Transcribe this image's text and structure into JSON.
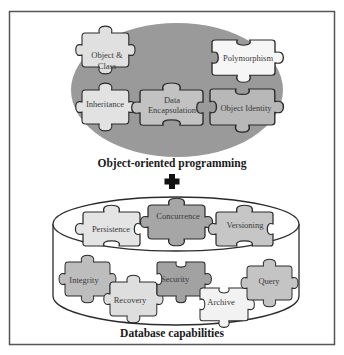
{
  "figure": {
    "frame": {
      "stroke": "#555555"
    },
    "colors": {
      "oop_ellipse": "#9a9a9a",
      "piece_outline": "#2b2b2b",
      "piece_light": "#e6e6e6",
      "piece_white": "#f6f6f6",
      "piece_mid": "#c4c4c4",
      "piece_dark": "#a8a8a8",
      "cylinder_fill": "#ffffff",
      "cylinder_stroke": "#2b2b2b",
      "plus_sign": "#111111"
    },
    "oop": {
      "title": "Object-oriented programming",
      "pieces": [
        {
          "label_lines": [
            "Object &",
            "Class"
          ],
          "shade": "light"
        },
        {
          "label_lines": [
            "Polymorphism"
          ],
          "shade": "white"
        },
        {
          "label_lines": [
            "Inheritance"
          ],
          "shade": "light"
        },
        {
          "label_lines": [
            "Data",
            "Encapsulation"
          ],
          "shade": "mid"
        },
        {
          "label_lines": [
            "Object Identity"
          ],
          "shade": "mid"
        }
      ]
    },
    "combine_symbol": "plus-icon",
    "database": {
      "title": "Database capabilities",
      "pieces": [
        {
          "label_lines": [
            "Persistence"
          ],
          "shade": "light"
        },
        {
          "label_lines": [
            "Concurrence"
          ],
          "shade": "dark"
        },
        {
          "label_lines": [
            "Versioning"
          ],
          "shade": "mid"
        },
        {
          "label_lines": [
            "Integrity"
          ],
          "shade": "mid"
        },
        {
          "label_lines": [
            "Recovery"
          ],
          "shade": "light"
        },
        {
          "label_lines": [
            "Security"
          ],
          "shade": "dark"
        },
        {
          "label_lines": [
            "Archive"
          ],
          "shade": "white"
        },
        {
          "label_lines": [
            "Query"
          ],
          "shade": "mid"
        }
      ]
    }
  }
}
